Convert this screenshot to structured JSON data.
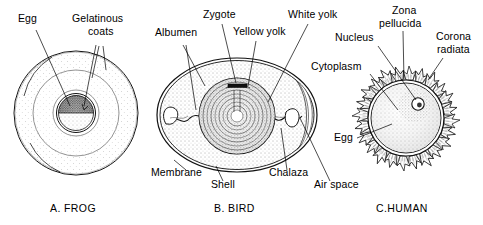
{
  "figure": {
    "background_color": "#ffffff",
    "ink_color": "#000000"
  },
  "panels": [
    {
      "id": "frog",
      "caption": "A. FROG",
      "caption_x": 78,
      "caption_y": 212,
      "labels": [
        {
          "name": "egg",
          "text": "Egg",
          "x": 18,
          "y": 22
        },
        {
          "name": "gelatinous-coats-line1",
          "text": "Gelatinous",
          "x": 72,
          "y": 22
        },
        {
          "name": "gelatinous-coats-line2",
          "text": "coats",
          "x": 88,
          "y": 35
        }
      ]
    },
    {
      "id": "bird",
      "caption": "B. BIRD",
      "caption_x": 215,
      "caption_y": 212,
      "labels": [
        {
          "name": "albumen",
          "text": "Albumen",
          "x": 164,
          "y": 36
        },
        {
          "name": "zygote",
          "text": "Zygote",
          "x": 207,
          "y": 18
        },
        {
          "name": "yellow-yolk",
          "text": "Yellow yolk",
          "x": 241,
          "y": 35
        },
        {
          "name": "white-yolk",
          "text": "White yolk",
          "x": 293,
          "y": 18
        },
        {
          "name": "membrane",
          "text": "Membrane",
          "x": 152,
          "y": 176
        },
        {
          "name": "shell",
          "text": "Shell",
          "x": 212,
          "y": 188
        },
        {
          "name": "chalaza",
          "text": "Chalaza",
          "x": 270,
          "y": 176
        },
        {
          "name": "air-space",
          "text": "Air space",
          "x": 313,
          "y": 188
        }
      ]
    },
    {
      "id": "human",
      "caption": "C.HUMAN",
      "caption_x": 378,
      "caption_y": 212,
      "labels": [
        {
          "name": "zona-pellucida-line1",
          "text": "Zona",
          "x": 394,
          "y": 14
        },
        {
          "name": "zona-pellucida-line2",
          "text": "pellucida",
          "x": 381,
          "y": 27
        },
        {
          "name": "corona-radiata-line1",
          "text": "Corona",
          "x": 437,
          "y": 40
        },
        {
          "name": "corona-radiata-line2",
          "text": "radiata",
          "x": 438,
          "y": 53
        },
        {
          "name": "nucleus",
          "text": "Nucleus",
          "x": 338,
          "y": 41
        },
        {
          "name": "cytoplasm",
          "text": "Cytoplasm",
          "x": 314,
          "y": 70
        },
        {
          "name": "egg",
          "text": "Egg",
          "x": 338,
          "y": 141
        }
      ]
    }
  ],
  "legend_terms": [
    "Egg",
    "Gelatinous coats",
    "Albumen",
    "Zygote",
    "Yellow yolk",
    "White yolk",
    "Membrane",
    "Shell",
    "Chalaza",
    "Air space",
    "Zona pellucida",
    "Corona radiata",
    "Nucleus",
    "Cytoplasm"
  ]
}
